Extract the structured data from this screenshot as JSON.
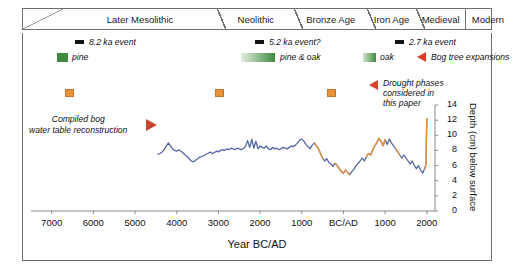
{
  "figure": {
    "periods": [
      {
        "label": "",
        "width_pct": 8.5,
        "slash": true,
        "sep": "none"
      },
      {
        "label": "Later Mesolithic",
        "width_pct": 33.0,
        "sep": "none"
      },
      {
        "label": "Neolithic",
        "width_pct": 16.5,
        "sep": "diag"
      },
      {
        "label": "Bronze Age",
        "width_pct": 15.5,
        "sep": "diag"
      },
      {
        "label": "Iron Age",
        "width_pct": 10.5,
        "sep": "diag"
      },
      {
        "label": "Medieval",
        "width_pct": 10.5,
        "sep": "diag"
      },
      {
        "label": "Modern",
        "width_pct": 9.5,
        "sep": "straight"
      }
    ],
    "legend": {
      "events": [
        {
          "label": "8.2 ka event",
          "marker": "black-bar"
        },
        {
          "label": "5.2 ka event?",
          "marker": "black-bar"
        },
        {
          "label": "2.7 ka event",
          "marker": "black-bar"
        }
      ],
      "trees": [
        {
          "label": "pine",
          "marker": "green-square"
        },
        {
          "label": "pine & oak",
          "marker": "green-gradient-bar"
        },
        {
          "label": "oak",
          "marker": "green-square-small"
        }
      ],
      "bog_tree_expansions": "Bog tree expansions",
      "drought_phases": "Drought phases\nconsidered in\nthis paper",
      "drought_phases_lines": [
        "Drought phases",
        "considered in",
        "this paper"
      ]
    },
    "annotation": {
      "compiled_label_lines": [
        "Compiled bog",
        "water table reconstruction"
      ]
    },
    "colors": {
      "curve_blue": "#5366a4",
      "curve_orange": "#e8913a",
      "tree_green": "#3f8a3f",
      "arrow_red": "#d9402a",
      "event_black": "#111111",
      "frame_grey": "#6f6f6f"
    }
  },
  "chart_data": {
    "type": "line",
    "title": "",
    "xlabel": "Year BC/AD",
    "ylabel": "Depth (cm) below surface",
    "xlim": [
      -7400,
      2100
    ],
    "ylim": [
      0,
      14
    ],
    "y_inverted": false,
    "grid": false,
    "legend_position": "top",
    "xticks": [
      -7000,
      -6000,
      -5000,
      -4000,
      -3000,
      -2000,
      -1000,
      0,
      1000,
      2000
    ],
    "xtick_labels": [
      "7000",
      "6000",
      "5000",
      "4000",
      "3000",
      "2000",
      "1000",
      "BC/AD",
      "1000",
      "2000"
    ],
    "yticks": [
      0,
      2,
      4,
      6,
      8,
      10,
      12,
      14
    ],
    "ytick_labels": [
      "0",
      "2",
      "4",
      "6",
      "8",
      "10",
      "12",
      "14"
    ],
    "series": [
      {
        "name": "Compiled bog water table reconstruction",
        "color": "#5366a4",
        "x": [
          -4450,
          -4400,
          -4350,
          -4300,
          -4250,
          -4200,
          -4150,
          -4100,
          -4050,
          -4000,
          -3950,
          -3900,
          -3850,
          -3800,
          -3750,
          -3700,
          -3650,
          -3600,
          -3550,
          -3500,
          -3450,
          -3400,
          -3350,
          -3300,
          -3250,
          -3200,
          -3150,
          -3100,
          -3050,
          -3000,
          -2950,
          -2900,
          -2850,
          -2800,
          -2750,
          -2700,
          -2650,
          -2600,
          -2550,
          -2500,
          -2450,
          -2400,
          -2350,
          -2300,
          -2250,
          -2200,
          -2150,
          -2100,
          -2050,
          -2000,
          -1950,
          -1900,
          -1850,
          -1800,
          -1750,
          -1700,
          -1650,
          -1600,
          -1550,
          -1500,
          -1450,
          -1400,
          -1350,
          -1300,
          -1250,
          -1200,
          -1150,
          -1100,
          -1050,
          -1000,
          -950,
          -900,
          -850,
          -800,
          -750,
          -700,
          -650,
          -600,
          -550,
          -500,
          -450,
          -400,
          -350,
          -300,
          -250,
          -200,
          -150,
          -100,
          -50,
          0,
          50,
          100,
          150,
          200,
          250,
          300,
          350,
          400,
          450,
          500,
          550,
          600,
          650,
          700,
          750,
          800,
          850,
          900,
          950,
          1000,
          1050,
          1100,
          1150,
          1200,
          1250,
          1300,
          1350,
          1400,
          1450,
          1500,
          1550,
          1600,
          1650,
          1700,
          1750,
          1800,
          1850,
          1900,
          1950,
          1980,
          2000
        ],
        "y": [
          7.5,
          7.6,
          7.8,
          8.1,
          8.6,
          9.0,
          8.6,
          8.2,
          8.0,
          7.9,
          8.1,
          7.9,
          7.7,
          7.4,
          7.2,
          6.9,
          6.6,
          6.5,
          6.7,
          6.9,
          7.1,
          7.2,
          7.3,
          7.5,
          7.6,
          7.8,
          7.6,
          7.7,
          7.9,
          7.8,
          8.0,
          8.1,
          8.0,
          8.2,
          8.1,
          8.3,
          8.2,
          8.1,
          8.3,
          8.2,
          8.1,
          8.3,
          8.5,
          9.3,
          8.4,
          9.5,
          8.3,
          9.2,
          8.2,
          8.6,
          8.4,
          8.3,
          8.6,
          8.2,
          8.1,
          8.4,
          8.2,
          8.3,
          8.1,
          8.2,
          8.4,
          8.3,
          8.2,
          8.4,
          8.6,
          8.5,
          8.7,
          9.0,
          9.4,
          9.5,
          9.2,
          8.8,
          8.5,
          8.2,
          8.7,
          9.0,
          8.6,
          8.2,
          7.6,
          7.0,
          6.6,
          6.9,
          6.4,
          6.2,
          5.9,
          6.3,
          6.0,
          5.6,
          5.2,
          5.0,
          5.4,
          5.1,
          4.8,
          5.2,
          5.5,
          6.0,
          6.3,
          6.6,
          7.0,
          6.6,
          7.2,
          7.6,
          7.4,
          8.0,
          8.6,
          9.0,
          9.6,
          9.2,
          8.6,
          9.4,
          8.8,
          9.5,
          9.0,
          8.6,
          8.2,
          7.8,
          7.4,
          7.0,
          7.4,
          7.0,
          6.6,
          6.2,
          6.6,
          6.0,
          5.6,
          6.0,
          5.4,
          5.0,
          5.6,
          6.2,
          12.2
        ]
      }
    ],
    "highlight_segments": [
      {
        "name": "drought phase",
        "color": "#e8913a",
        "x_start": -700,
        "x_end": -500
      },
      {
        "name": "drought phase",
        "color": "#e8913a",
        "x_start": -200,
        "x_end": 150
      },
      {
        "name": "drought phase",
        "color": "#e8913a",
        "x_start": 550,
        "x_end": 1000
      },
      {
        "name": "drought phase",
        "color": "#e8913a",
        "x_start": 1250,
        "x_end": 1350
      },
      {
        "name": "drought phase",
        "color": "#e8913a",
        "x_start": 1950,
        "x_end": 2000
      }
    ],
    "event_markers": [
      {
        "label": "8.2 ka event",
        "x": -6250,
        "type": "black-bar"
      },
      {
        "label": "5.2 ka event?",
        "x": -3250,
        "type": "black-bar"
      },
      {
        "label": "2.7 ka event",
        "x": -750,
        "type": "black-bar"
      }
    ],
    "drought_markers": [
      {
        "x": -6250,
        "type": "orange-square"
      },
      {
        "x": -3250,
        "type": "orange-square"
      },
      {
        "x": -750,
        "type": "orange-square"
      }
    ]
  }
}
